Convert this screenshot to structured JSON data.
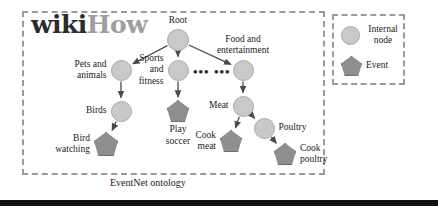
{
  "figure": {
    "caption": "EventNet ontology",
    "logo": {
      "part1": "wiki",
      "part2": "How"
    }
  },
  "colors": {
    "internal_node_fill": "#c9c9c9",
    "event_node_fill": "#8e8e8e",
    "dashed_border": "#9a9a9a",
    "edge": "#4a4a4a",
    "text": "#1a1a1a",
    "logo_dark": "#2b2b2b",
    "logo_gray": "#9e9e9e",
    "rule": "#121212"
  },
  "legend": {
    "items": [
      {
        "shape": "circle",
        "label": "Internal\nnode"
      },
      {
        "shape": "pentagon",
        "label": "Event"
      }
    ]
  },
  "ellipsis": "•••  •••",
  "graph": {
    "type": "tree",
    "nodes": [
      {
        "id": "root",
        "label": "Root",
        "type": "internal",
        "x": 178,
        "y": 40,
        "r": 11,
        "label_pos": "top"
      },
      {
        "id": "pets",
        "label": "Pets and\nanimals",
        "type": "internal",
        "x": 121,
        "y": 70,
        "r": 10.5,
        "label_pos": "left"
      },
      {
        "id": "sports",
        "label": "Sports\nand\nfitness",
        "type": "internal",
        "x": 178,
        "y": 70,
        "r": 10.5,
        "label_pos": "left"
      },
      {
        "id": "food",
        "label": "Food and\nentertainment",
        "type": "internal",
        "x": 243,
        "y": 70,
        "r": 10.5,
        "label_pos": "top"
      },
      {
        "id": "birds",
        "label": "Birds",
        "type": "internal",
        "x": 121,
        "y": 111,
        "r": 10.5,
        "label_pos": "left"
      },
      {
        "id": "playsoccer",
        "label": "Play\nsoccer",
        "type": "event",
        "x": 178,
        "y": 111,
        "r": 11,
        "label_pos": "bottom"
      },
      {
        "id": "meat",
        "label": "Meat",
        "type": "internal",
        "x": 243,
        "y": 106,
        "r": 10.5,
        "label_pos": "left"
      },
      {
        "id": "birdwatching",
        "label": "Bird\nwatching",
        "type": "event",
        "x": 106,
        "y": 144,
        "r": 12,
        "label_pos": "left"
      },
      {
        "id": "cookmeat",
        "label": "Cook\nmeat",
        "type": "event",
        "x": 231,
        "y": 141,
        "r": 11,
        "label_pos": "left"
      },
      {
        "id": "poultry",
        "label": "Poultry",
        "type": "internal",
        "x": 264,
        "y": 128,
        "r": 10.5,
        "label_pos": "right"
      },
      {
        "id": "cookpoultry",
        "label": "Cook\npoultry",
        "type": "event",
        "x": 285,
        "y": 154,
        "r": 11,
        "label_pos": "right"
      }
    ],
    "edges": [
      {
        "from": "root",
        "to": "pets"
      },
      {
        "from": "root",
        "to": "sports"
      },
      {
        "from": "root",
        "to": "food"
      },
      {
        "from": "pets",
        "to": "birds"
      },
      {
        "from": "sports",
        "to": "playsoccer"
      },
      {
        "from": "food",
        "to": "meat"
      },
      {
        "from": "birds",
        "to": "birdwatching"
      },
      {
        "from": "meat",
        "to": "cookmeat"
      },
      {
        "from": "meat",
        "to": "poultry"
      },
      {
        "from": "poultry",
        "to": "cookpoultry"
      }
    ]
  }
}
